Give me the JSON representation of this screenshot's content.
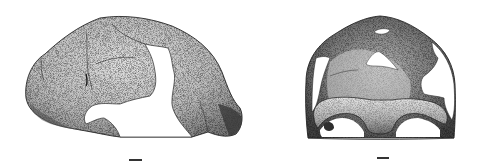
{
  "figure": {
    "views": [
      {
        "id": "lateral",
        "label": "lateral-view",
        "description": "fossil cranium, lateral view"
      },
      {
        "id": "frontal",
        "label": "frontal-view",
        "description": "fossil cranium, frontal view"
      }
    ],
    "scale_bars": [
      {
        "view": "lateral",
        "x": 129,
        "y": 159,
        "width": 13
      },
      {
        "view": "frontal",
        "x": 377,
        "y": 157,
        "width": 12
      }
    ],
    "colors": {
      "background": "#ffffff",
      "bone_light": "#d4d4d4",
      "bone_mid": "#9a9a9a",
      "bone_dark": "#4a4a4a",
      "outline": "#2a2a2a"
    }
  }
}
